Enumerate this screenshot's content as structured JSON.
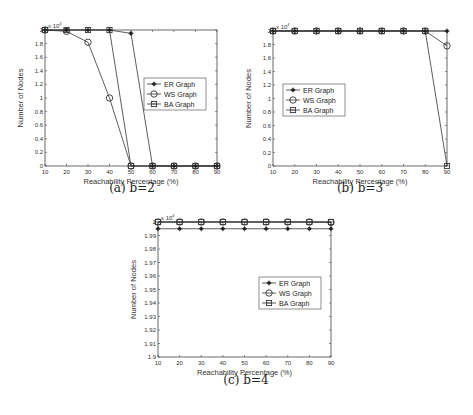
{
  "figure": {
    "captions": [
      "(a) b=2",
      "(b) b=3",
      "(c) b=4"
    ]
  },
  "chart_data": [
    {
      "id": "a",
      "type": "line",
      "title": "",
      "caption": "(a) b=2",
      "xlabel": "Reachability Percentage (%)",
      "ylabel": "Number of Nodes",
      "y_multiplier_label": "x 10^4",
      "x": [
        10,
        20,
        30,
        40,
        50,
        60,
        70,
        80,
        90
      ],
      "xticks": [
        "10",
        "20",
        "30",
        "40",
        "50",
        "60",
        "70",
        "80",
        "90"
      ],
      "yticks": [
        "0",
        "0.2",
        "0.4",
        "0.6",
        "0.8",
        "1",
        "1.2",
        "1.4",
        "1.6",
        "1.8",
        "2"
      ],
      "ylim": [
        0,
        2
      ],
      "xlim": [
        10,
        90
      ],
      "grid": false,
      "legend_position": "center-right",
      "series": [
        {
          "name": "ER Graph",
          "marker": "star",
          "values": [
            2,
            2,
            2,
            2,
            1.95,
            0,
            0,
            0,
            0
          ]
        },
        {
          "name": "WS Graph",
          "marker": "circle",
          "values": [
            2,
            1.98,
            1.82,
            1.0,
            0,
            0,
            0,
            0,
            0
          ]
        },
        {
          "name": "BA Graph",
          "marker": "square",
          "values": [
            2,
            2,
            2,
            2,
            0,
            0,
            0,
            0,
            0
          ]
        }
      ]
    },
    {
      "id": "b",
      "type": "line",
      "title": "",
      "caption": "(b) b=3",
      "xlabel": "Reachability Percentage (%)",
      "ylabel": "Number of Nodes",
      "y_multiplier_label": "x 10^4",
      "x": [
        10,
        20,
        30,
        40,
        50,
        60,
        70,
        80,
        90
      ],
      "xticks": [
        "10",
        "20",
        "30",
        "40",
        "50",
        "60",
        "70",
        "80",
        "90"
      ],
      "yticks": [
        "0",
        "0.2",
        "0.4",
        "0.6",
        "0.8",
        "1",
        "1.2",
        "1.4",
        "1.6",
        "1.8",
        "2"
      ],
      "ylim": [
        0,
        2
      ],
      "xlim": [
        10,
        90
      ],
      "grid": false,
      "legend_position": "center-left",
      "series": [
        {
          "name": "ER Graph",
          "marker": "star",
          "values": [
            2,
            2,
            2,
            2,
            2,
            2,
            2,
            2,
            2
          ]
        },
        {
          "name": "WS Graph",
          "marker": "circle",
          "values": [
            2,
            2,
            2,
            2,
            2,
            2,
            2,
            2,
            1.78
          ]
        },
        {
          "name": "BA Graph",
          "marker": "square",
          "values": [
            2,
            2,
            2,
            2,
            2,
            2,
            2,
            2,
            0
          ]
        }
      ]
    },
    {
      "id": "c",
      "type": "line",
      "title": "",
      "caption": "(c) b=4",
      "xlabel": "Reachability Percentage (%)",
      "ylabel": "Number of Nodes",
      "y_multiplier_label": "x 10^4",
      "x": [
        10,
        20,
        30,
        40,
        50,
        60,
        70,
        80,
        90
      ],
      "xticks": [
        "10",
        "20",
        "30",
        "40",
        "50",
        "60",
        "70",
        "80",
        "90"
      ],
      "yticks": [
        "1.9",
        "1.91",
        "1.92",
        "1.93",
        "1.94",
        "1.95",
        "1.96",
        "1.97",
        "1.98",
        "1.99",
        "2"
      ],
      "ylim": [
        1.9,
        2.0
      ],
      "xlim": [
        10,
        90
      ],
      "grid": false,
      "legend_position": "center-right",
      "series": [
        {
          "name": "ER Graph",
          "marker": "star",
          "values": [
            1.995,
            1.995,
            1.995,
            1.995,
            1.995,
            1.995,
            1.995,
            1.995,
            1.995
          ]
        },
        {
          "name": "WS Graph",
          "marker": "circle",
          "values": [
            2.0,
            2.0,
            2.0,
            2.0,
            2.0,
            2.0,
            2.0,
            2.0,
            1.9997
          ]
        },
        {
          "name": "BA Graph",
          "marker": "square",
          "values": [
            2.0,
            2.0,
            2.0,
            2.0,
            2.0,
            2.0,
            2.0,
            2.0,
            2.0
          ]
        }
      ]
    }
  ]
}
